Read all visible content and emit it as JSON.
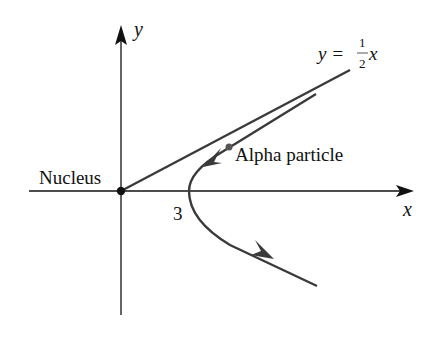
{
  "diagram": {
    "axes": {
      "x_label": "x",
      "y_label": "y"
    },
    "labels": {
      "nucleus": "Nucleus",
      "particle": "Alpha particle",
      "vertex_tick": "3",
      "asymptote_lhs": "y =",
      "asymptote_num": "1",
      "asymptote_den": "2",
      "asymptote_var": "x"
    },
    "colors": {
      "axis": "#111111",
      "curve": "#3a3a3a",
      "asymptote": "#3a3a3a"
    }
  }
}
